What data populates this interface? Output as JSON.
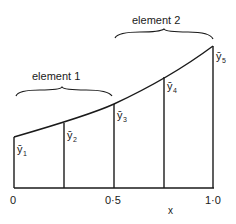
{
  "diagram": {
    "elements": [
      {
        "label": "element 1",
        "from": 0,
        "to": 0.5
      },
      {
        "label": "element 2",
        "from": 0.5,
        "to": 1.0
      }
    ],
    "ordinates": [
      {
        "symbol": "ȳ",
        "sub": "1",
        "x": 0
      },
      {
        "symbol": "ȳ",
        "sub": "2",
        "x": 0.25
      },
      {
        "symbol": "ȳ",
        "sub": "3",
        "x": 0.5
      },
      {
        "symbol": "ȳ",
        "sub": "4",
        "x": 0.75
      },
      {
        "symbol": "ȳ",
        "sub": "5",
        "x": 1.0
      }
    ],
    "ticks": [
      "0",
      "0·5",
      "1·0"
    ],
    "xlabel": "x"
  }
}
